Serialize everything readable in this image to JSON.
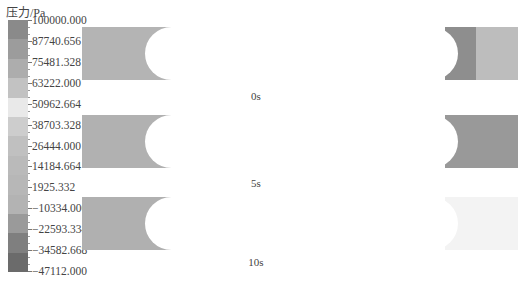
{
  "legend": {
    "title": "压力/Pa",
    "ticks": [
      "100000.000",
      "87740.656",
      "75481.328",
      "63222.000",
      "50962.664",
      "38703.328",
      "26444.000",
      "14184.664",
      "1925.332",
      "−10334.000",
      "−22593.334",
      "−34582.668",
      "−47112.000"
    ],
    "band_colors": [
      "#8a8a8a",
      "#9c9c9c",
      "#adadad",
      "#c2c2c2",
      "#e9e9e9",
      "#cdcdcd",
      "#c0c0c0",
      "#bababa",
      "#b7b7b7",
      "#b3b3b3",
      "#9a9a9a",
      "#7f7f7f",
      "#6b6b6b"
    ]
  },
  "panels": [
    {
      "label": "0s",
      "left_color": "#b4b4b4",
      "right_segments": [
        {
          "from": 363,
          "to": 394,
          "color": "#8e8e8e"
        },
        {
          "from": 394,
          "to": 436,
          "color": "#bdbdbd"
        }
      ]
    },
    {
      "label": "5s",
      "left_color": "#b1b1b1",
      "right_segments": [
        {
          "from": 363,
          "to": 436,
          "color": "#999999"
        }
      ]
    },
    {
      "label": "10s",
      "left_color": "#b0b0b0",
      "right_segments": [
        {
          "from": 363,
          "to": 436,
          "color": "#f3f3f3"
        }
      ]
    }
  ],
  "chart_data": {
    "type": "heatmap",
    "title": "",
    "colorbar": {
      "label": "压力/Pa",
      "min": -47112.0,
      "max": 100000.0,
      "ticks": [
        100000.0,
        87740.656,
        75481.328,
        63222.0,
        50962.664,
        38703.328,
        26444.0,
        14184.664,
        1925.332,
        -10334.0,
        -22593.334,
        -34582.668,
        -47112.0
      ]
    },
    "subplots": [
      {
        "label": "0s",
        "left_region_pressure_approx": 20000,
        "right_inner_region_pressure_approx": -30000,
        "right_outer_region_pressure_approx": 30000
      },
      {
        "label": "5s",
        "left_region_pressure_approx": 20000,
        "right_region_pressure_approx": -25000
      },
      {
        "label": "10s",
        "left_region_pressure_approx": 20000,
        "right_region_pressure_approx": 63222
      }
    ]
  }
}
